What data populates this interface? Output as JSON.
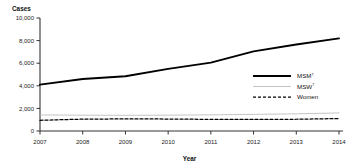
{
  "chart_data": {
    "type": "line",
    "title": "",
    "xlabel": "Year",
    "ylabel": "Cases",
    "x": [
      2007,
      2008,
      2009,
      2010,
      2011,
      2012,
      2013,
      2014
    ],
    "categories": [
      "2007",
      "2008",
      "2009",
      "2010",
      "2011",
      "2012",
      "2013",
      "2014"
    ],
    "series": [
      {
        "name": "MSM",
        "footnote_marker": "†",
        "style": "solid-thick",
        "color": "#000000",
        "values": [
          4100,
          4600,
          4850,
          5500,
          6050,
          7050,
          7650,
          8200
        ]
      },
      {
        "name": "MSW",
        "footnote_marker": "†",
        "style": "solid-thin",
        "color": "#b5b5b5",
        "values": [
          1420,
          1400,
          1390,
          1400,
          1430,
          1470,
          1520,
          1600
        ]
      },
      {
        "name": "Women",
        "footnote_marker": "",
        "style": "dashed",
        "color": "#000000",
        "values": [
          950,
          1050,
          1070,
          1060,
          1030,
          1020,
          1040,
          1100
        ]
      }
    ],
    "ylim": [
      0,
      10000
    ],
    "ytick_values": [
      0,
      2000,
      4000,
      6000,
      8000,
      10000
    ],
    "ytick_labels": [
      "0",
      "2,000",
      "4,000",
      "6,000",
      "8,000",
      "10,000"
    ],
    "xlim": [
      2007,
      2014
    ],
    "grid": false,
    "legend_position": "right-middle",
    "legend_entries": [
      {
        "label": "MSM",
        "sup": "†"
      },
      {
        "label": "MSW",
        "sup": "†"
      },
      {
        "label": "Women",
        "sup": ""
      }
    ]
  }
}
